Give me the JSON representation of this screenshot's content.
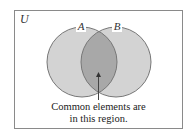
{
  "diagram": {
    "type": "venn",
    "universe_label": "U",
    "sets": [
      {
        "label": "A",
        "cx": 82,
        "cy": 62,
        "r": 35
      },
      {
        "label": "B",
        "cx": 116,
        "cy": 62,
        "r": 35
      }
    ],
    "colors": {
      "circle_fill": "#d3d3d3",
      "intersection_fill": "#a8a8a8",
      "stroke": "#777777",
      "frame": "#8a8a8a"
    },
    "annotation": {
      "line1": "Common elements are",
      "line2": "in this region."
    }
  }
}
